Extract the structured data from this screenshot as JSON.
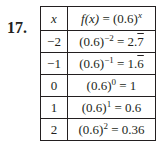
{
  "problem": {
    "number": "17.",
    "table": {
      "headers": {
        "x": "x",
        "fx_lhs": "f(x)",
        "fx_eq": " = (0.6)",
        "fx_exp": "x"
      },
      "rows": [
        {
          "x": "−2",
          "base": "(0.6)",
          "exp": "−2",
          "eq": " = 2.",
          "result_plain": "",
          "result_bar": "7"
        },
        {
          "x": "−1",
          "base": "(0.6)",
          "exp": "−1",
          "eq": " = 1.",
          "result_plain": "",
          "result_bar": "6"
        },
        {
          "x": "0",
          "base": "(0.6)",
          "exp": "0",
          "eq": " = 1",
          "result_plain": "",
          "result_bar": ""
        },
        {
          "x": "1",
          "base": "(0.6)",
          "exp": "1",
          "eq": " = 0.6",
          "result_plain": "",
          "result_bar": ""
        },
        {
          "x": "2",
          "base": "(0.6)",
          "exp": "2",
          "eq": " = 0.36",
          "result_plain": "",
          "result_bar": ""
        }
      ]
    }
  }
}
